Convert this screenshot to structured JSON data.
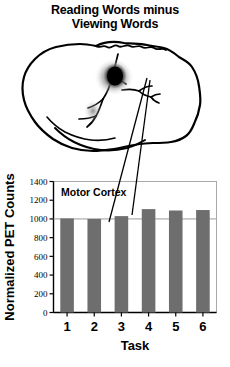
{
  "figure": {
    "title_line1": "Reading Words minus",
    "title_line2": "Viewing Words"
  },
  "brain": {
    "view_label": "lateral-brain-outline",
    "activation_label": "pet-activation-blob",
    "outline_color": "#000000",
    "activation_color": "#111111"
  },
  "chart_data": {
    "type": "bar",
    "title": "Reading Words minus Viewing Words",
    "panel_label": "Motor Cortex",
    "categories": [
      "1",
      "2",
      "3",
      "4",
      "5",
      "6"
    ],
    "values": [
      1005,
      1000,
      1030,
      1105,
      1090,
      1095
    ],
    "xlabel": "Task",
    "ylabel": "Normalized PET Counts",
    "ylim": [
      0,
      1400
    ],
    "ytick_labels": [
      "0",
      "200",
      "400",
      "600",
      "800",
      "1000",
      "1200",
      "1400"
    ],
    "ytick_values": [
      0,
      200,
      400,
      600,
      800,
      1000,
      1200,
      1400
    ],
    "reference_line": 1000,
    "grid": false,
    "legend": "none",
    "bar_color": "#6e6e6e",
    "axis_color": "#000000",
    "frame_color": "#aaaaaa"
  },
  "annotations": {
    "leader_line_1": "blob-to-task-3",
    "leader_line_2": "blob-to-task-4"
  }
}
